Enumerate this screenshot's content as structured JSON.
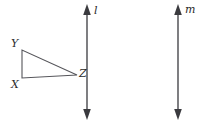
{
  "figure": {
    "name": "geometry-figure-triangle-and-parallel-lines",
    "background_color": "#ffffff",
    "stroke_color": "#55555a",
    "line_color": "#3a3a3e",
    "label_color": "#2b2b2b",
    "width": 208,
    "height": 124
  },
  "triangle": {
    "name": "triangle-XYZ",
    "vertices": [
      {
        "label": "Y",
        "x": 22,
        "y": 50,
        "label_x": 11,
        "label_y": 47
      },
      {
        "label": "X",
        "x": 22,
        "y": 78,
        "label_x": 11,
        "label_y": 88
      },
      {
        "label": "Z",
        "x": 77,
        "y": 75,
        "label_x": 79,
        "label_y": 77
      }
    ],
    "right_angle_at": "X"
  },
  "lines": [
    {
      "label": "l",
      "name": "line-l",
      "x": 87,
      "y_top": 8,
      "y_bottom": 116,
      "label_x": 94,
      "label_y": 14,
      "double_headed": true
    },
    {
      "label": "m",
      "name": "line-m",
      "x": 178,
      "y_top": 8,
      "y_bottom": 116,
      "label_x": 185,
      "label_y": 13,
      "double_headed": true
    }
  ]
}
